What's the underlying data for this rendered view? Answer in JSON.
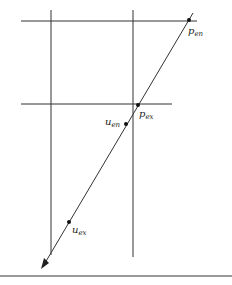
{
  "diagram": {
    "labels": {
      "p_en": {
        "base": "p",
        "sub": "en"
      },
      "p_ex": {
        "base": "p",
        "sub": "ex"
      },
      "u_en": {
        "base": "u",
        "sub": "en"
      },
      "u_ex": {
        "base": "u",
        "sub": "ex"
      }
    },
    "colors": {
      "line": "#333333",
      "rule": "#777777"
    }
  }
}
